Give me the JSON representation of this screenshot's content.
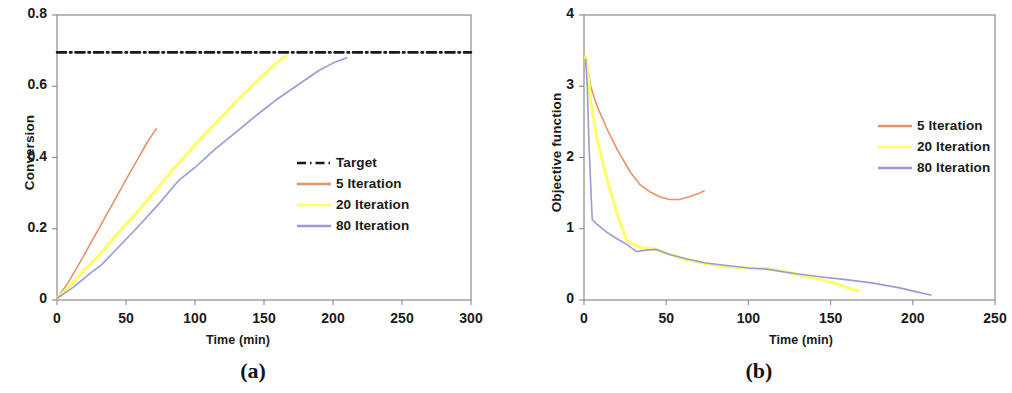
{
  "figure": {
    "panels": [
      {
        "caption": "(a)",
        "xlabel": "Time (min)",
        "ylabel": "Conversion",
        "xticks": [
          "0",
          "50",
          "100",
          "150",
          "200",
          "250",
          "300"
        ],
        "yticks": [
          "0",
          "0.2",
          "0.4",
          "0.6",
          "0.8"
        ],
        "legend": [
          {
            "label": "Target",
            "color": "#1a1a1a",
            "style": "dashdot"
          },
          {
            "label": "5 Iteration",
            "color": "#e8926a",
            "style": "solid"
          },
          {
            "label": "20 Iteration",
            "color": "#ffff66",
            "style": "solid"
          },
          {
            "label": "80 Iteration",
            "color": "#9a9ad6",
            "style": "solid"
          }
        ]
      },
      {
        "caption": "(b)",
        "xlabel": "Time (min)",
        "ylabel": "Objective function",
        "xticks": [
          "0",
          "50",
          "100",
          "150",
          "200",
          "250"
        ],
        "yticks": [
          "0",
          "1",
          "2",
          "3",
          "4"
        ],
        "legend": [
          {
            "label": "5 Iteration",
            "color": "#e8926a",
            "style": "solid"
          },
          {
            "label": "20 Iteration",
            "color": "#ffff66",
            "style": "solid"
          },
          {
            "label": "80 Iteration",
            "color": "#9a9ad6",
            "style": "solid"
          }
        ]
      }
    ]
  },
  "chart_data": [
    {
      "type": "line",
      "panel": "(a)",
      "title": "",
      "xlabel": "Time (min)",
      "ylabel": "Conversion",
      "xlim": [
        0,
        300
      ],
      "ylim": [
        0,
        0.8
      ],
      "xticks": [
        0,
        50,
        100,
        150,
        200,
        250,
        300
      ],
      "yticks": [
        0,
        0.2,
        0.4,
        0.6,
        0.8
      ],
      "grid": false,
      "legend_position": "center-right",
      "series": [
        {
          "name": "Target",
          "color": "#1a1a1a",
          "style": "dashdot",
          "x": [
            0,
            300
          ],
          "y": [
            0.695,
            0.695
          ]
        },
        {
          "name": "5 Iteration",
          "color": "#e8926a",
          "style": "solid",
          "x": [
            0,
            8,
            18,
            30,
            40,
            50,
            58,
            65,
            70,
            72
          ],
          "y": [
            0.005,
            0.048,
            0.115,
            0.198,
            0.268,
            0.338,
            0.392,
            0.44,
            0.47,
            0.48
          ]
        },
        {
          "name": "20 Iteration",
          "color": "#ffff66",
          "style": "solid",
          "x": [
            0,
            10,
            20,
            32,
            45,
            58,
            72,
            86,
            100,
            115,
            130,
            145,
            158,
            166
          ],
          "y": [
            0.005,
            0.042,
            0.085,
            0.132,
            0.192,
            0.246,
            0.31,
            0.375,
            0.435,
            0.497,
            0.558,
            0.615,
            0.662,
            0.685
          ]
        },
        {
          "name": "80 Iteration",
          "color": "#9a9ad6",
          "style": "solid",
          "x": [
            0,
            12,
            24,
            32,
            45,
            58,
            72,
            88,
            100,
            115,
            130,
            145,
            160,
            175,
            190,
            200,
            210
          ],
          "y": [
            0.005,
            0.036,
            0.075,
            0.098,
            0.15,
            0.203,
            0.262,
            0.335,
            0.372,
            0.425,
            0.472,
            0.52,
            0.565,
            0.605,
            0.645,
            0.665,
            0.68
          ]
        }
      ]
    },
    {
      "type": "line",
      "panel": "(b)",
      "title": "",
      "xlabel": "Time (min)",
      "ylabel": "Objective function",
      "xlim": [
        0,
        250
      ],
      "ylim": [
        0,
        4
      ],
      "xticks": [
        0,
        50,
        100,
        150,
        200,
        250
      ],
      "yticks": [
        0,
        1,
        2,
        3,
        4
      ],
      "grid": false,
      "legend_position": "center-right",
      "series": [
        {
          "name": "5 Iteration",
          "color": "#e8926a",
          "style": "solid",
          "x": [
            1,
            2,
            4,
            8,
            14,
            20,
            28,
            34,
            40,
            46,
            52,
            58,
            64,
            70,
            73
          ],
          "y": [
            3.4,
            3.3,
            3.0,
            2.72,
            2.4,
            2.12,
            1.8,
            1.62,
            1.52,
            1.45,
            1.41,
            1.41,
            1.45,
            1.5,
            1.53
          ]
        },
        {
          "name": "20 Iteration",
          "color": "#ffff66",
          "style": "solid",
          "x": [
            1,
            2,
            4,
            8,
            14,
            20,
            26,
            30,
            36,
            42,
            50,
            60,
            72,
            86,
            100,
            112,
            126,
            140,
            152,
            163,
            167
          ],
          "y": [
            3.42,
            3.25,
            2.8,
            2.25,
            1.7,
            1.22,
            0.84,
            0.78,
            0.73,
            0.72,
            0.66,
            0.58,
            0.52,
            0.47,
            0.45,
            0.44,
            0.38,
            0.31,
            0.24,
            0.15,
            0.13
          ]
        },
        {
          "name": "80 Iteration",
          "color": "#9a9ad6",
          "style": "solid",
          "x": [
            1,
            2,
            3,
            5,
            8,
            14,
            20,
            26,
            32,
            38,
            44,
            52,
            62,
            74,
            88,
            100,
            112,
            126,
            142,
            158,
            175,
            192,
            205,
            211
          ],
          "y": [
            3.38,
            3.0,
            2.2,
            1.13,
            1.06,
            0.95,
            0.86,
            0.78,
            0.68,
            0.7,
            0.71,
            0.64,
            0.58,
            0.52,
            0.48,
            0.45,
            0.43,
            0.38,
            0.33,
            0.29,
            0.24,
            0.17,
            0.1,
            0.07
          ]
        }
      ]
    }
  ]
}
